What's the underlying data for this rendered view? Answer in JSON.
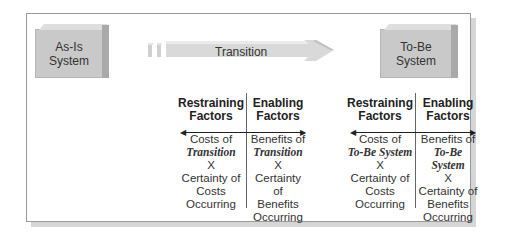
{
  "diagram": {
    "as_is_box": {
      "line1": "As-Is",
      "line2": "System"
    },
    "to_be_box": {
      "line1": "To-Be",
      "line2": "System"
    },
    "transition_arrow": {
      "label": "Transition"
    },
    "left_group": {
      "restraining": {
        "header1": "Restraining",
        "header2": "Factors",
        "l1": "Costs of",
        "l2": "Transition",
        "l3": "X",
        "l4": "Certainty of",
        "l5": "Costs",
        "l6": "Occurring"
      },
      "enabling": {
        "header1": "Enabling",
        "header2": "Factors",
        "l1": "Benefits of",
        "l2": "Transition",
        "l3": "X",
        "l4": "Certainty of",
        "l5": "Benefits",
        "l6": "Occurring"
      }
    },
    "right_group": {
      "restraining": {
        "header1": "Restraining",
        "header2": "Factors",
        "l1": "Costs of",
        "l2": "To-Be System",
        "l3": "X",
        "l4": "Certainty of",
        "l5": "Costs",
        "l6": "Occurring"
      },
      "enabling": {
        "header1": "Enabling",
        "header2": "Factors",
        "l1": "Benefits of",
        "l2": "To-Be System",
        "l3": "X",
        "l4": "Certainty of",
        "l5": "Benefits",
        "l6": "Occurring"
      }
    }
  },
  "colors": {
    "box_fill": "#c9c9c9",
    "arrow_fill": "#d9d9d9",
    "frame_border": "#9a9a9a"
  }
}
